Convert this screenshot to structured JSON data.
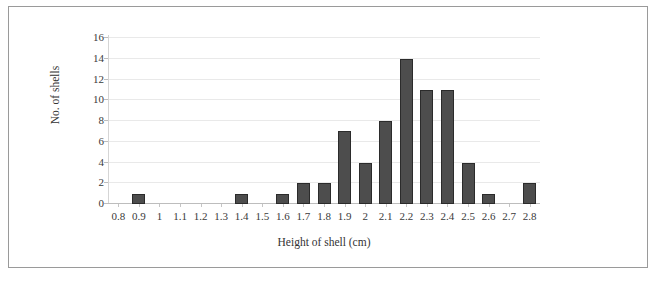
{
  "chart_data": {
    "type": "bar",
    "title": "",
    "xlabel": "Height of shell (cm)",
    "ylabel": "No. of shells",
    "categories": [
      "0.8",
      "0.9",
      "1",
      "1.1",
      "1.2",
      "1.3",
      "1.4",
      "1.5",
      "1.6",
      "1.7",
      "1.8",
      "1.9",
      "2",
      "2.1",
      "2.2",
      "2.3",
      "2.4",
      "2.5",
      "2.6",
      "2.7",
      "2.8"
    ],
    "values": [
      0,
      1,
      0,
      0,
      0,
      0,
      1,
      0,
      1,
      2,
      2,
      7,
      4,
      8,
      14,
      11,
      11,
      4,
      1,
      0,
      2
    ],
    "ylim": [
      0,
      16
    ],
    "y_ticks": [
      0,
      2,
      4,
      6,
      8,
      10,
      12,
      14,
      16
    ],
    "grid": true,
    "legend": false,
    "bar_color": "#4d4d4d",
    "bar_border_color": "#2b2b2b",
    "gridline_color": "#e9e9e9",
    "axis_color": "#bdbdbd",
    "frame_border_color": "#9a9a9a",
    "background": "#ffffff"
  }
}
